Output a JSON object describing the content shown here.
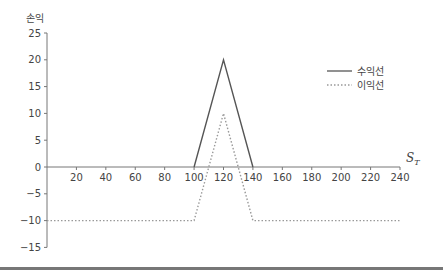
{
  "chart_data": {
    "type": "line",
    "title": "",
    "ylabel": "손익",
    "xlabel": "S_T",
    "xlabel_main": "S",
    "xlabel_sub": "T",
    "xlim": [
      0,
      240
    ],
    "ylim": [
      -15,
      25
    ],
    "x_ticks": [
      20,
      40,
      60,
      80,
      100,
      120,
      140,
      160,
      180,
      200,
      220,
      240
    ],
    "y_ticks": [
      25,
      20,
      15,
      10,
      5,
      0,
      -5,
      -10,
      -15
    ],
    "grid": false,
    "legend_position": "upper right",
    "series": [
      {
        "name": "수익선",
        "style": "solid",
        "color": "#555555",
        "x": [
          100,
          120,
          140
        ],
        "y": [
          0,
          20,
          0
        ]
      },
      {
        "name": "이익선",
        "style": "dotted",
        "color": "#999999",
        "x": [
          0,
          100,
          120,
          140,
          240
        ],
        "y": [
          -10,
          -10,
          10,
          -10,
          -10
        ]
      }
    ]
  },
  "legend": {
    "items": [
      {
        "label": "수익선"
      },
      {
        "label": "이익선"
      }
    ]
  }
}
